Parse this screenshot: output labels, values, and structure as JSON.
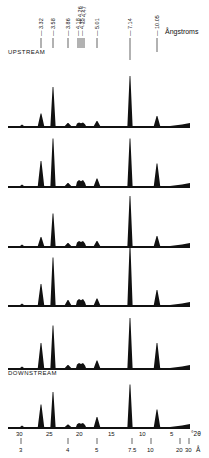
{
  "chart_data": {
    "type": "line",
    "title": "",
    "xlabel": "°2θ",
    "x_axis_secondary_label": "Å",
    "ylabel": "",
    "x_ticks_2theta": [
      30,
      25,
      20,
      15,
      10,
      5
    ],
    "x_ticks_angstrom": [
      "3",
      "4",
      "5",
      "7.5",
      "10",
      "20",
      "30"
    ],
    "top_unit_label": "Ångstroms",
    "peak_labels_angstrom": [
      "3.32",
      "3.58",
      "3.86",
      "4.18",
      "4.26",
      "4.35",
      "4.47",
      "5.01",
      "7.14",
      "10.05"
    ],
    "trace_labels": {
      "top": "UPSTREAM",
      "bottom": "DOWNSTREAM"
    },
    "series": [
      {
        "name": "trace-1 (upstream)",
        "peaks": [
          {
            "d": 3.32,
            "h": 0.25
          },
          {
            "d": 3.58,
            "h": 0.78
          },
          {
            "d": 3.86,
            "h": 0.06
          },
          {
            "d": 4.26,
            "h": 0.07
          },
          {
            "d": 5.01,
            "h": 0.1
          },
          {
            "d": 7.14,
            "h": 1.0
          },
          {
            "d": 10.05,
            "h": 0.2
          }
        ]
      },
      {
        "name": "trace-2",
        "peaks": [
          {
            "d": 3.32,
            "h": 0.5
          },
          {
            "d": 3.58,
            "h": 0.95
          },
          {
            "d": 3.86,
            "h": 0.06
          },
          {
            "d": 4.26,
            "h": 0.12
          },
          {
            "d": 5.01,
            "h": 0.15
          },
          {
            "d": 7.14,
            "h": 0.95
          },
          {
            "d": 10.05,
            "h": 0.45
          }
        ]
      },
      {
        "name": "trace-3",
        "peaks": [
          {
            "d": 3.32,
            "h": 0.18
          },
          {
            "d": 3.58,
            "h": 0.65
          },
          {
            "d": 3.86,
            "h": 0.06
          },
          {
            "d": 4.26,
            "h": 0.1
          },
          {
            "d": 5.01,
            "h": 0.1
          },
          {
            "d": 7.14,
            "h": 1.0
          },
          {
            "d": 10.05,
            "h": 0.2
          }
        ]
      },
      {
        "name": "trace-4",
        "peaks": [
          {
            "d": 3.32,
            "h": 0.42
          },
          {
            "d": 3.58,
            "h": 0.95
          },
          {
            "d": 3.86,
            "h": 0.1
          },
          {
            "d": 4.26,
            "h": 0.12
          },
          {
            "d": 5.01,
            "h": 0.13
          },
          {
            "d": 7.14,
            "h": 1.2
          },
          {
            "d": 10.05,
            "h": 0.3
          }
        ]
      },
      {
        "name": "trace-5",
        "peaks": [
          {
            "d": 3.32,
            "h": 0.5
          },
          {
            "d": 3.58,
            "h": 0.85
          },
          {
            "d": 3.86,
            "h": 0.06
          },
          {
            "d": 4.26,
            "h": 0.1
          },
          {
            "d": 5.01,
            "h": 0.15
          },
          {
            "d": 7.14,
            "h": 1.0
          },
          {
            "d": 10.05,
            "h": 0.5
          }
        ]
      },
      {
        "name": "trace-6 (downstream)",
        "peaks": [
          {
            "d": 3.32,
            "h": 0.45
          },
          {
            "d": 3.58,
            "h": 0.7
          },
          {
            "d": 3.86,
            "h": 0.05
          },
          {
            "d": 4.26,
            "h": 0.08
          },
          {
            "d": 5.01,
            "h": 0.2
          },
          {
            "d": 7.14,
            "h": 0.85
          },
          {
            "d": 10.05,
            "h": 0.35
          }
        ]
      }
    ],
    "grid": false,
    "legend": "none"
  }
}
